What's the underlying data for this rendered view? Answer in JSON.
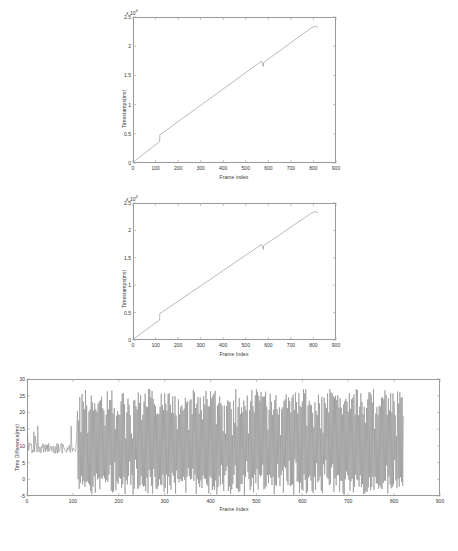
{
  "figure": {
    "background_color": "#ffffff",
    "line_color": "#8c8c8c",
    "axis_color": "#9a9a9a"
  },
  "charts": [
    {
      "id": "timestamps-top",
      "type": "line",
      "title": "",
      "xlabel": "Frame index",
      "ylabel": "Timestamps(ms)",
      "y_exponent_label": "x 10",
      "y_exponent_power": "4",
      "xlim": [
        0,
        900
      ],
      "ylim": [
        0,
        25000
      ],
      "xticks": [
        0,
        100,
        200,
        300,
        400,
        500,
        600,
        700,
        800,
        900
      ],
      "xticklabels": [
        "0",
        "100",
        "200",
        "300",
        "400",
        "500",
        "600",
        "700",
        "800",
        "900"
      ],
      "yticks": [
        0,
        5000,
        10000,
        15000,
        20000,
        25000
      ],
      "yticklabels": [
        "0",
        "0.5",
        "1",
        "1.5",
        "2",
        "2.5"
      ],
      "grid": false,
      "legend": null,
      "series": [
        {
          "name": "Timestamps",
          "x": [
            0,
            10,
            20,
            30,
            40,
            50,
            60,
            70,
            80,
            90,
            100,
            110,
            118,
            119,
            130,
            150,
            175,
            200,
            225,
            250,
            275,
            300,
            325,
            350,
            375,
            400,
            425,
            450,
            475,
            500,
            525,
            550,
            570,
            578,
            579,
            590,
            610,
            630,
            650,
            670,
            690,
            710,
            730,
            750,
            770,
            790,
            810,
            820
          ],
          "y": [
            120,
            420,
            720,
            1020,
            1320,
            1620,
            1920,
            2220,
            2520,
            2820,
            3120,
            3420,
            3660,
            4850,
            5120,
            5680,
            6380,
            7080,
            7780,
            8480,
            9180,
            9880,
            10580,
            11280,
            11980,
            12680,
            13380,
            14080,
            14780,
            15480,
            16180,
            16880,
            17440,
            16540,
            17200,
            17520,
            18080,
            18640,
            19200,
            19760,
            20320,
            20880,
            21440,
            22000,
            22560,
            23120,
            23450,
            23200
          ]
        }
      ],
      "annotations": [
        {
          "label": "step discontinuity",
          "x": 118,
          "y": 3660
        },
        {
          "label": "step discontinuity",
          "x": 578,
          "y": 17440
        }
      ]
    },
    {
      "id": "timestamps-middle",
      "type": "line",
      "title": "",
      "xlabel": "Frame Index",
      "ylabel": "Timestamps(ms)",
      "y_exponent_label": "x 10",
      "y_exponent_power": "4",
      "xlim": [
        0,
        900
      ],
      "ylim": [
        0,
        25000
      ],
      "xticks": [
        0,
        100,
        200,
        300,
        400,
        500,
        600,
        700,
        800,
        900
      ],
      "xticklabels": [
        "0",
        "100",
        "200",
        "300",
        "400",
        "500",
        "600",
        "700",
        "800",
        "900"
      ],
      "yticks": [
        0,
        5000,
        10000,
        15000,
        20000,
        25000
      ],
      "yticklabels": [
        "0",
        "0.5",
        "1",
        "1.5",
        "2",
        "2.5"
      ],
      "grid": false,
      "legend": null,
      "series": [
        {
          "name": "Timestamps",
          "x": [
            0,
            10,
            20,
            30,
            40,
            50,
            60,
            70,
            80,
            90,
            100,
            110,
            118,
            119,
            130,
            150,
            175,
            200,
            225,
            250,
            275,
            300,
            325,
            350,
            375,
            400,
            425,
            450,
            475,
            500,
            525,
            550,
            570,
            578,
            579,
            590,
            610,
            630,
            650,
            670,
            690,
            710,
            730,
            750,
            770,
            790,
            810,
            820
          ],
          "y": [
            120,
            420,
            720,
            1020,
            1320,
            1620,
            1920,
            2220,
            2520,
            2820,
            3120,
            3420,
            3660,
            4850,
            5120,
            5680,
            6380,
            7080,
            7780,
            8480,
            9180,
            9880,
            10580,
            11280,
            11980,
            12680,
            13380,
            14080,
            14780,
            15480,
            16180,
            16880,
            17440,
            16540,
            17200,
            17520,
            18080,
            18640,
            19200,
            19760,
            20320,
            20880,
            21440,
            22000,
            22560,
            23120,
            23450,
            23200
          ]
        }
      ],
      "annotations": [
        {
          "label": "step discontinuity",
          "x": 118,
          "y": 3660
        },
        {
          "label": "step discontinuity",
          "x": 578,
          "y": 17440
        }
      ]
    },
    {
      "id": "time-difference",
      "type": "line",
      "title": "",
      "xlabel": "Frame Index",
      "ylabel": "Time Difference(ms)",
      "y_exponent_label": "",
      "y_exponent_power": "",
      "xlim": [
        0,
        900
      ],
      "ylim": [
        -5,
        30
      ],
      "xticks": [
        0,
        100,
        200,
        300,
        400,
        500,
        600,
        700,
        800,
        900
      ],
      "xticklabels": [
        "0",
        "100",
        "200",
        "300",
        "400",
        "500",
        "600",
        "700",
        "800",
        "900"
      ],
      "yticks": [
        -5,
        0,
        5,
        10,
        15,
        20,
        25,
        30
      ],
      "yticklabels": [
        "-5",
        "0",
        "5",
        "10",
        "15",
        "20",
        "25",
        "30"
      ],
      "grid": false,
      "legend": null,
      "series": [
        {
          "name": "Time Difference",
          "description": "Low amplitude noise around 8-11 ms for frames 0-110, then large oscillation between -5 and 27 ms for frames 110-820",
          "x": [
            2,
            4,
            6,
            8,
            10,
            12,
            14,
            16,
            18,
            20,
            22,
            24,
            26,
            28,
            30,
            32,
            34,
            36,
            38,
            40,
            42,
            44,
            46,
            48,
            50,
            52,
            54,
            56,
            58,
            60,
            62,
            64,
            66,
            68,
            70,
            72,
            74,
            76,
            78,
            80,
            82,
            84,
            86,
            88,
            90,
            92,
            94,
            96,
            98,
            100,
            102,
            104,
            106,
            108,
            110
          ],
          "y": [
            9,
            11,
            8,
            12,
            7,
            14,
            8,
            10,
            9,
            11,
            8,
            10,
            9,
            13,
            8,
            9,
            10,
            8,
            11,
            9,
            8,
            10,
            9,
            8,
            10,
            9,
            11,
            8,
            9,
            10,
            8,
            9,
            15,
            9,
            8,
            10,
            9,
            8,
            11,
            9,
            10,
            8,
            9,
            10,
            9,
            8,
            10,
            9,
            11,
            9,
            8,
            10,
            9,
            10,
            9
          ]
        }
      ],
      "annotations": [
        {
          "label": "regime change",
          "x": 110,
          "y": 10
        }
      ]
    }
  ]
}
